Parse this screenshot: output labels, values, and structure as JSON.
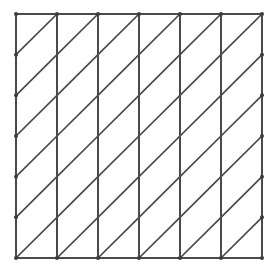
{
  "figure": {
    "name": "diagonal-lattice-truss-grid",
    "title": "",
    "width": 274,
    "height": 270,
    "background_color": "#ffffff"
  },
  "style": {
    "line_color": "#4a4a4a",
    "diagonal_color": "#4a4a4a",
    "node_color": "#3d3d3d",
    "vertical_stroke_width": 2.0,
    "horizontal_stroke_width": 2.0,
    "diagonal_stroke_width": 1.7,
    "node_radius": 2.0
  },
  "chart_data": {
    "type": "diagram",
    "title": "",
    "subtitle": "",
    "xlabel": "",
    "ylabel": "",
    "legend": [],
    "annotations": [],
    "grid": true,
    "geometry": {
      "columns": 7,
      "rows": 7,
      "cells_x": 6,
      "cells_y": 6,
      "x_min": 16,
      "x_max": 262,
      "y_min": 14,
      "y_max": 258,
      "spacing_x": 41.0,
      "spacing_y": 40.667,
      "x_positions": [
        16,
        57,
        98,
        139,
        180,
        221,
        262
      ],
      "y_positions": [
        14,
        54.7,
        95.3,
        136,
        176.7,
        217.3,
        258
      ],
      "diagonal_direction": "bottom-left-to-top-right",
      "diagonal_span_cols": 1,
      "diagonal_span_rows": 1,
      "interior_horizontals": false,
      "top_chord": true,
      "bottom_chord": true,
      "nodes_visible": true
    }
  }
}
